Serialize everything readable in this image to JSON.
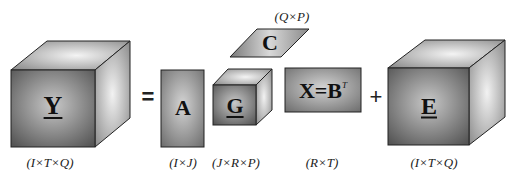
{
  "equation": {
    "equals": "=",
    "plus": "+"
  },
  "blocks": [
    {
      "id": "Y",
      "symbol": "Y",
      "underlined": true,
      "shape": "cube",
      "dims": "(I×T×Q)"
    },
    {
      "id": "A",
      "symbol": "A",
      "underlined": false,
      "shape": "matrix",
      "dims": "(I×J)"
    },
    {
      "id": "G",
      "symbol": "G",
      "underlined": true,
      "shape": "cube",
      "dims": "(J×R×P)"
    },
    {
      "id": "C",
      "symbol": "C",
      "underlined": false,
      "shape": "parallelogram",
      "dims": "(Q×P)"
    },
    {
      "id": "X",
      "symbol": "X=B",
      "superscript": "T",
      "underlined": false,
      "shape": "matrix",
      "dims": "(R×T)"
    },
    {
      "id": "E",
      "symbol": "E",
      "underlined": true,
      "shape": "cube",
      "dims": "(I×T×Q)"
    }
  ],
  "colors": {
    "front_dark": "#5a5a5a",
    "front_light": "#bdbdbd",
    "side_light": "#e6e6e6",
    "edge": "#222222"
  }
}
